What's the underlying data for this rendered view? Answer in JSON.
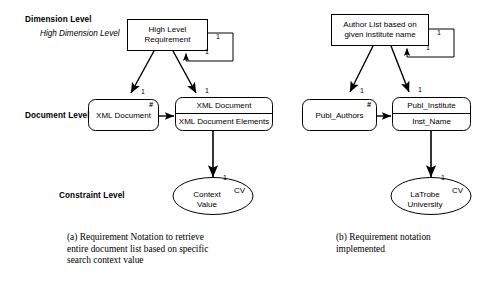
{
  "figure": {
    "levels": {
      "dimension": "Dimension Level",
      "dimension_sub": "High Dimension Level",
      "document": "Document Level",
      "constraint": "Constraint Level"
    },
    "panel_a": {
      "high_level_requirement": "High Level\nRequirement",
      "hlr_line1": "High Level",
      "hlr_line2": "Requirement",
      "self_loop_card_right": "1",
      "self_loop_card_bottom": "1",
      "left_doc_card": "1",
      "right_doc_card": "1",
      "left_doc_box": "XML Document",
      "left_doc_hash": "#",
      "right_doc_header": "XML Document",
      "right_doc_body": "XML Document Elements",
      "constraint_card": "1",
      "constraint_line1": "Context",
      "constraint_line2": "Value",
      "constraint_tag": "CV"
    },
    "panel_b": {
      "hlr_line1": "Author List based on",
      "hlr_line2": "given institute name",
      "self_loop_card_right": "1",
      "self_loop_card_bottom": "1",
      "left_doc_card": "1",
      "right_doc_card": "1",
      "left_doc_box": "Publ_Authors",
      "left_doc_hash": "#",
      "right_doc_header": "Publ_Institute",
      "right_doc_body": "Inst_Name",
      "constraint_card": "1",
      "constraint_line1": "LaTrobe",
      "constraint_line2": "University",
      "constraint_tag": "CV"
    },
    "captions": {
      "a": "(a) Requirement Notation to retrieve entire document list based on specific search context value",
      "b": "(b) Requirement notation implemented"
    },
    "colors": {
      "stroke": "#000000",
      "background": "#ffffff",
      "text": "#000000"
    }
  }
}
